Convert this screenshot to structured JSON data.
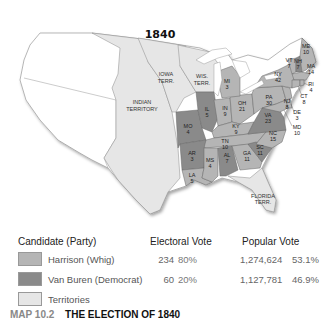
{
  "map": {
    "title": "1840",
    "colors": {
      "whig": "#b5b5b5",
      "democrat": "#8a8a8a",
      "territory": "#e6e6e6",
      "foreign": "#ffffff",
      "lake": "#ffffff",
      "border": "#777777"
    },
    "territories": [
      {
        "name": "IOWA",
        "name2": "TERR."
      },
      {
        "name": "WIS.",
        "name2": "TERR."
      },
      {
        "name": "INDIAN",
        "name2": "TERRITORY"
      },
      {
        "name": "FLORIDA",
        "name2": "TERR."
      }
    ],
    "states": [
      {
        "abbr": "ME",
        "votes": "10",
        "winner": "whig"
      },
      {
        "abbr": "VT",
        "votes": "7",
        "winner": "whig"
      },
      {
        "abbr": "NH",
        "votes": "7",
        "winner": "democrat"
      },
      {
        "abbr": "MA",
        "votes": "14",
        "winner": "whig"
      },
      {
        "abbr": "RI",
        "votes": "4",
        "winner": "whig"
      },
      {
        "abbr": "CT",
        "votes": "8",
        "winner": "whig"
      },
      {
        "abbr": "NY",
        "votes": "42",
        "winner": "whig"
      },
      {
        "abbr": "NJ",
        "votes": "8",
        "winner": "whig"
      },
      {
        "abbr": "PA",
        "votes": "30",
        "winner": "whig"
      },
      {
        "abbr": "DE",
        "votes": "3",
        "winner": "whig"
      },
      {
        "abbr": "MD",
        "votes": "10",
        "winner": "whig"
      },
      {
        "abbr": "VA",
        "votes": "23",
        "winner": "democrat"
      },
      {
        "abbr": "NC",
        "votes": "15",
        "winner": "whig"
      },
      {
        "abbr": "SC",
        "votes": "11",
        "winner": "democrat"
      },
      {
        "abbr": "GA",
        "votes": "11",
        "winner": "whig"
      },
      {
        "abbr": "AL",
        "votes": "7",
        "winner": "democrat"
      },
      {
        "abbr": "MS",
        "votes": "4",
        "winner": "whig"
      },
      {
        "abbr": "LA",
        "votes": "5",
        "winner": "whig"
      },
      {
        "abbr": "TN",
        "votes": "10",
        "winner": "whig"
      },
      {
        "abbr": "KY",
        "votes": "9",
        "winner": "whig"
      },
      {
        "abbr": "OH",
        "votes": "21",
        "winner": "whig"
      },
      {
        "abbr": "IN",
        "votes": "9",
        "winner": "whig"
      },
      {
        "abbr": "IL",
        "votes": "5",
        "winner": "democrat"
      },
      {
        "abbr": "MI",
        "votes": "3",
        "winner": "whig"
      },
      {
        "abbr": "MO",
        "votes": "4",
        "winner": "democrat"
      },
      {
        "abbr": "AR",
        "votes": "3",
        "winner": "democrat"
      }
    ]
  },
  "legend": {
    "headers": {
      "candidate": "Candidate (Party)",
      "electoral": "Electoral Vote",
      "popular": "Popular Vote"
    },
    "rows": [
      {
        "label": "Harrison (Whig)",
        "ev": "234",
        "ev_pct": "80%",
        "pv": "1,274,624",
        "pv_pct": "53.1%",
        "color": "#b5b5b5"
      },
      {
        "label": "Van Buren (Democrat)",
        "ev": "60",
        "ev_pct": "20%",
        "pv": "1,127,781",
        "pv_pct": "46.9%",
        "color": "#8a8a8a"
      },
      {
        "label": "Territories",
        "color": "#e6e6e6"
      }
    ]
  },
  "caption": {
    "number": "MAP 10.2",
    "title": "THE ELECTION OF 1840"
  }
}
